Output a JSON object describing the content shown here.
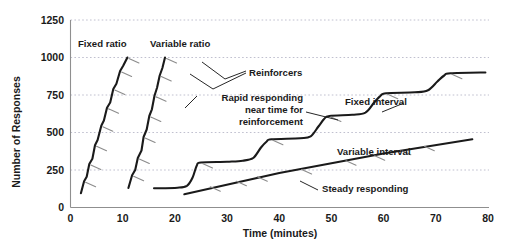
{
  "chart_data": {
    "type": "line",
    "title": "",
    "subtitle": "",
    "xlabel": "Time (minutes)",
    "ylabel": "Number of Responses",
    "xlim": [
      0,
      80
    ],
    "ylim": [
      0,
      1250
    ],
    "grid": true,
    "grid_axis": "y",
    "legend_position": "inline-annotations",
    "x_ticks": [
      "0",
      "10",
      "20",
      "30",
      "40",
      "50",
      "60",
      "70",
      "80"
    ],
    "y_ticks": [
      "0",
      "250",
      "500",
      "750",
      "1000",
      "1250"
    ],
    "series": [
      {
        "name": "Fixed ratio",
        "label_x": 4.2,
        "label_y": 1105,
        "points": [
          [
            2.0,
            95
          ],
          [
            2.6,
            175
          ],
          [
            3.1,
            205
          ],
          [
            3.6,
            290
          ],
          [
            4.2,
            325
          ],
          [
            4.7,
            415
          ],
          [
            5.2,
            450
          ],
          [
            5.9,
            545
          ],
          [
            6.4,
            580
          ],
          [
            7.0,
            665
          ],
          [
            7.6,
            700
          ],
          [
            8.2,
            790
          ],
          [
            8.8,
            825
          ],
          [
            9.5,
            910
          ],
          [
            10.1,
            945
          ],
          [
            10.9,
            1000
          ]
        ],
        "reinforcer_marks": [
          [
            2.6,
            175
          ],
          [
            3.6,
            290
          ],
          [
            4.7,
            415
          ],
          [
            5.9,
            545
          ],
          [
            7.0,
            665
          ],
          [
            8.2,
            790
          ],
          [
            9.5,
            910
          ],
          [
            10.9,
            1000
          ]
        ]
      },
      {
        "name": "Variable ratio",
        "label_x": 12.6,
        "label_y": 1105,
        "points": [
          [
            11.1,
            130
          ],
          [
            11.8,
            215
          ],
          [
            12.4,
            250
          ],
          [
            12.9,
            330
          ],
          [
            13.6,
            380
          ],
          [
            14.0,
            470
          ],
          [
            14.6,
            520
          ],
          [
            15.1,
            610
          ],
          [
            15.6,
            655
          ],
          [
            16.1,
            745
          ],
          [
            16.6,
            800
          ],
          [
            17.1,
            880
          ],
          [
            17.6,
            930
          ],
          [
            18.1,
            1000
          ]
        ],
        "reinforcer_marks": [
          [
            11.8,
            215
          ],
          [
            12.9,
            330
          ],
          [
            14.0,
            470
          ],
          [
            15.1,
            610
          ],
          [
            16.1,
            745
          ],
          [
            17.1,
            880
          ],
          [
            18.1,
            1000
          ]
        ]
      },
      {
        "name": "Fixed interval",
        "label_x": 56.5,
        "label_y": 720,
        "points": [
          [
            16.0,
            128
          ],
          [
            20.5,
            132
          ],
          [
            22.3,
            145
          ],
          [
            23.4,
            200
          ],
          [
            24.2,
            280
          ],
          [
            25.0,
            300
          ],
          [
            30.0,
            305
          ],
          [
            33.0,
            312
          ],
          [
            35.0,
            330
          ],
          [
            36.5,
            400
          ],
          [
            37.6,
            440
          ],
          [
            38.5,
            455
          ],
          [
            44.0,
            462
          ],
          [
            46.0,
            475
          ],
          [
            47.5,
            540
          ],
          [
            48.6,
            590
          ],
          [
            49.6,
            610
          ],
          [
            54.0,
            618
          ],
          [
            56.5,
            632
          ],
          [
            58.2,
            700
          ],
          [
            59.4,
            745
          ],
          [
            60.5,
            762
          ],
          [
            66.0,
            768
          ],
          [
            68.5,
            782
          ],
          [
            70.3,
            840
          ],
          [
            71.6,
            880
          ],
          [
            72.8,
            895
          ],
          [
            79.5,
            900
          ]
        ],
        "reinforcer_marks": [
          [
            25.0,
            300
          ],
          [
            38.5,
            455
          ],
          [
            49.6,
            610
          ],
          [
            60.5,
            762
          ],
          [
            72.8,
            895
          ]
        ]
      },
      {
        "name": "Variable interval",
        "label_x": 55.5,
        "label_y": 420,
        "points": [
          [
            21.8,
            88
          ],
          [
            40.0,
            230
          ],
          [
            60.0,
            360
          ],
          [
            77.0,
            455
          ]
        ],
        "reinforcer_marks": [
          [
            26.5,
            145
          ],
          [
            31.5,
            182
          ],
          [
            35.5,
            212
          ],
          [
            44.0,
            260
          ],
          [
            52.5,
            318
          ],
          [
            58.0,
            352
          ],
          [
            63.0,
            388
          ],
          [
            67.5,
            415
          ]
        ]
      }
    ],
    "annotations": [
      {
        "id": "reinforcers",
        "text": "Reinforcers",
        "x": 30.0,
        "y": 880
      },
      {
        "id": "rapid-responding",
        "lines": [
          "Rapid responding",
          "near time for",
          "reinforcement"
        ],
        "x": 27.5,
        "y": 690
      },
      {
        "id": "steady-responding",
        "text": "Steady responding",
        "x": 48.5,
        "y": 150
      }
    ]
  },
  "labels": {
    "y_axis_title": "Number of Responses",
    "x_axis_title": "Time (minutes)",
    "fixed_ratio": "Fixed ratio",
    "variable_ratio": "Variable ratio",
    "fixed_interval": "Fixed interval",
    "variable_interval": "Variable interval",
    "reinforcers": "Reinforcers",
    "rapid_line1": "Rapid responding",
    "rapid_line2": "near time for",
    "rapid_line3": "reinforcement",
    "steady_responding": "Steady responding"
  },
  "ticks": {
    "y": [
      "1250",
      "1000",
      "750",
      "500",
      "250",
      "0"
    ],
    "x": [
      "0",
      "10",
      "20",
      "30",
      "40",
      "50",
      "60",
      "70",
      "80"
    ]
  },
  "colors": {
    "curve": "#1a1a1a",
    "grid": "#b9b9c9",
    "axis": "#8f8f8f",
    "hatch": "#8c8c8c",
    "background": "#ffffff",
    "text": "#1a1a1a"
  }
}
